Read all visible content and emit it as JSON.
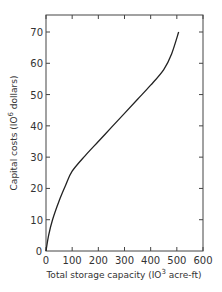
{
  "chart_data": {
    "type": "line",
    "title": "",
    "xlabel": "Total storage capacity (10^3 acre-ft)",
    "ylabel": "Capital costs (10^6 dollars)",
    "xlim": [
      0,
      600
    ],
    "ylim": [
      0,
      75
    ],
    "x_ticks": [
      0,
      100,
      200,
      300,
      400,
      500,
      600
    ],
    "y_ticks": [
      0,
      10,
      20,
      30,
      40,
      50,
      60,
      70
    ],
    "grid": false,
    "legend": null,
    "series": [
      {
        "name": "Capital cost curve",
        "x": [
          0,
          10,
          25,
          50,
          75,
          100,
          150,
          200,
          250,
          300,
          350,
          400,
          450,
          480,
          507
        ],
        "y": [
          0,
          5,
          10,
          16,
          21,
          25.5,
          30.5,
          35,
          39.5,
          44,
          48.5,
          53,
          58,
          63,
          70
        ]
      }
    ]
  },
  "labels": {
    "x_ticks": [
      "0",
      "100",
      "200",
      "300",
      "400",
      "500",
      "600"
    ],
    "y_ticks": [
      "0",
      "10",
      "20",
      "30",
      "40",
      "50",
      "60",
      "70"
    ],
    "xlabel_main": "Total storage capacity (IO",
    "xlabel_sup": "3",
    "xlabel_tail": " acre-ft)",
    "ylabel_main": "Capital costs (IO",
    "ylabel_sup": "6",
    "ylabel_tail": " dollars)"
  }
}
